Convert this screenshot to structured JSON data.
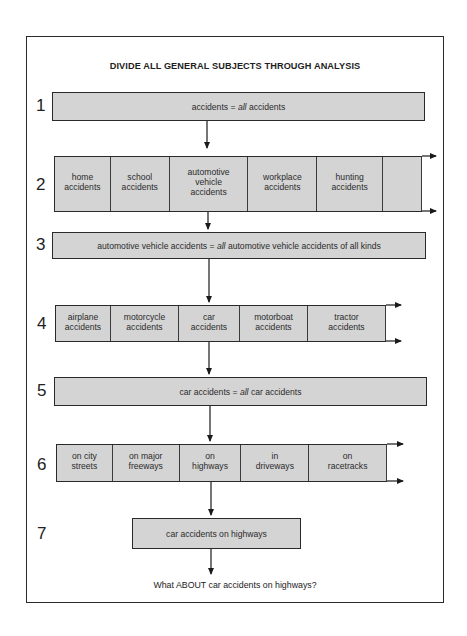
{
  "title": "DIVIDE ALL GENERAL SUBJECTS THROUGH ANALYSIS",
  "steps": [
    {
      "number": "1",
      "pre": "accidents = ",
      "italic": "all",
      "post": " accidents"
    },
    {
      "number": "2",
      "cells": [
        "home\naccidents",
        "school\naccidents",
        "automotive\nvehicle\naccidents",
        "workplace\naccidents",
        "hunting\naccidents",
        ""
      ]
    },
    {
      "number": "3",
      "pre": "automotive vehicle accidents = ",
      "italic": "all",
      "post": " automotive vehicle accidents of all kinds"
    },
    {
      "number": "4",
      "cells": [
        "airplane\naccidents",
        "motorcycle\naccidents",
        "car\naccidents",
        "motorboat\naccidents",
        "tractor\naccidents"
      ]
    },
    {
      "number": "5",
      "pre": "car accidents = ",
      "italic": "all",
      "post": " car accidents"
    },
    {
      "number": "6",
      "cells": [
        "on city\nstreets",
        "on major\nfreeways",
        "on\nhighways",
        "in\ndriveways",
        "on\nracetracks"
      ]
    },
    {
      "number": "7",
      "text": "car accidents on highways"
    }
  ],
  "question": "What ABOUT car accidents on highways?",
  "colors": {
    "box_fill": "#d4d4d4",
    "line": "#2a2a2a"
  }
}
